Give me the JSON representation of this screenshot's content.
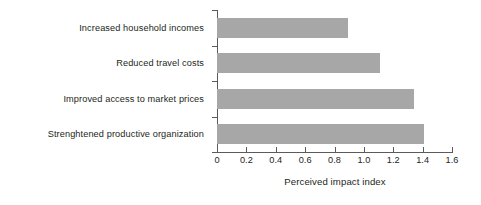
{
  "chart_data": {
    "type": "bar",
    "orientation": "horizontal",
    "title": "",
    "xlabel": "Perceived impact index",
    "ylabel": "",
    "categories": [
      "Increased household incomes",
      "Reduced travel costs",
      "Improved access to market prices",
      "Strenghtened productive organization"
    ],
    "values": [
      0.89,
      1.11,
      1.34,
      1.41
    ],
    "xlim": [
      0,
      1.6
    ],
    "xticks": [
      0,
      0.2,
      0.4,
      0.6,
      0.8,
      1.0,
      1.2,
      1.4,
      1.6
    ],
    "xtick_labels": [
      "0",
      "0.2",
      "0.4",
      "0.6",
      "0.8",
      "1.0",
      "1.2",
      "1.4",
      "1.6"
    ],
    "grid": false,
    "legend": null,
    "bar_color": "#a7a7a7",
    "axis_color": "#5b5b5b",
    "text_color": "#231f20",
    "background": "#ffffff"
  }
}
